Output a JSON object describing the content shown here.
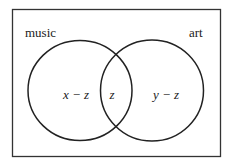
{
  "diagram": {
    "type": "venn",
    "sets": [
      {
        "name": "music",
        "label": "music"
      },
      {
        "name": "art",
        "label": "art"
      }
    ],
    "regions": {
      "music_only": "x − z",
      "both": "z",
      "art_only": "y − z"
    },
    "colors": {
      "stroke": "#222222",
      "background": "#ffffff"
    }
  }
}
